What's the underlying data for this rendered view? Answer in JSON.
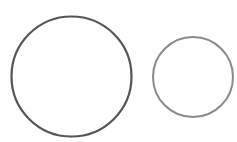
{
  "diagram": {
    "shapes": [
      {
        "type": "circle",
        "cx": 71.5,
        "cy": 76.5,
        "r": 60,
        "stroke": "#555555",
        "stroke_width": 2.2
      },
      {
        "type": "circle",
        "cx": 193,
        "cy": 77,
        "r": 40,
        "stroke": "#8a8a8a",
        "stroke_width": 2
      }
    ]
  }
}
